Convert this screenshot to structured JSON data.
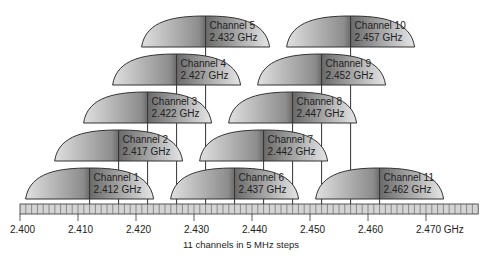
{
  "diagram": {
    "caption": "11 channels in 5 MHz steps",
    "axis": {
      "start_mhz": 2400,
      "end_mhz": 2479,
      "labels": [
        {
          "mhz": 2400,
          "text": "2.400"
        },
        {
          "mhz": 2410,
          "text": "2.410"
        },
        {
          "mhz": 2420,
          "text": "2.420"
        },
        {
          "mhz": 2430,
          "text": "2.430"
        },
        {
          "mhz": 2440,
          "text": "2.440"
        },
        {
          "mhz": 2450,
          "text": "2.450"
        },
        {
          "mhz": 2460,
          "text": "2.460"
        },
        {
          "mhz": 2470,
          "text": "2.470 GHz"
        }
      ]
    },
    "channels": [
      {
        "name": "Channel 1",
        "freq": "2.412 GHz",
        "mhz": 2412,
        "row": 4
      },
      {
        "name": "Channel 2",
        "freq": "2.417 GHz",
        "mhz": 2417,
        "row": 3
      },
      {
        "name": "Channel 3",
        "freq": "2.422 GHz",
        "mhz": 2422,
        "row": 2
      },
      {
        "name": "Channel 4",
        "freq": "2.427 GHz",
        "mhz": 2427,
        "row": 1
      },
      {
        "name": "Channel 5",
        "freq": "2.432 GHz",
        "mhz": 2432,
        "row": 0
      },
      {
        "name": "Channel 6",
        "freq": "2.437 GHz",
        "mhz": 2437,
        "row": 4
      },
      {
        "name": "Channel 7",
        "freq": "2.442 GHz",
        "mhz": 2442,
        "row": 3
      },
      {
        "name": "Channel 8",
        "freq": "2.447 GHz",
        "mhz": 2447,
        "row": 2
      },
      {
        "name": "Channel 9",
        "freq": "2.452 GHz",
        "mhz": 2452,
        "row": 1
      },
      {
        "name": "Channel 10",
        "freq": "2.457 GHz",
        "mhz": 2457,
        "row": 0
      },
      {
        "name": "Channel 11",
        "freq": "2.462 GHz",
        "mhz": 2462,
        "row": 4
      }
    ],
    "colors": {
      "dome_dark": "#6e6e6e",
      "dome_light": "#e2e2e2",
      "outline": "#333333",
      "axis_fill": "#d4d4d4"
    }
  }
}
